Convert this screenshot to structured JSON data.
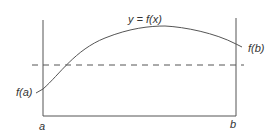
{
  "diagram": {
    "type": "mean-value-theorem-integral-illustration",
    "labels": {
      "curve": "y = f(x)",
      "fa": "f(a)",
      "fb": "f(b)",
      "a": "a",
      "b": "b"
    },
    "elements": {
      "left_boundary": "vertical line at x = a",
      "right_boundary": "vertical line at x = b",
      "baseline": "horizontal x-axis segment from a to b",
      "curve": "y = f(x), rising from f(a) to a maximum then falling to f(b)",
      "mean_line": "dashed horizontal line (average value)"
    },
    "colors": {
      "stroke": "#555555",
      "text": "#333333",
      "background": "#ffffff"
    }
  }
}
